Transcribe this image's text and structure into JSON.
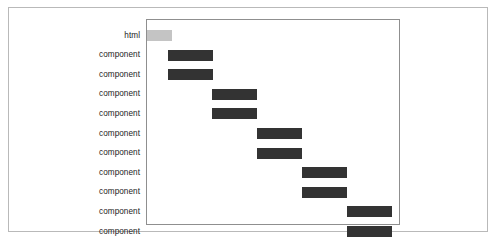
{
  "figure": {
    "background_color": "#ffffff",
    "card_border_color": "#b9b9b9",
    "plot_frame_border_color": "#8f8f8f"
  },
  "chart_data": {
    "type": "bar",
    "orientation": "horizontal",
    "subtype": "gantt-waterfall-timeline",
    "title": "",
    "subtitle": "",
    "xlabel": "",
    "ylabel": "",
    "grid": false,
    "legend": false,
    "xlim": [
      0,
      100
    ],
    "xticks": [],
    "xticklabels": [],
    "categories": [
      "html",
      "component",
      "component",
      "component",
      "component",
      "component",
      "component",
      "component",
      "component",
      "component",
      "component"
    ],
    "bar_color": "#333333",
    "first_bar_color": "#c4c4c4",
    "bars": [
      {
        "label": "html",
        "start": 0.0,
        "end": 9.8,
        "color": "#c4c4c4"
      },
      {
        "label": "component",
        "start": 8.3,
        "end": 26.0,
        "color": "#333333"
      },
      {
        "label": "component",
        "start": 8.3,
        "end": 26.0,
        "color": "#333333"
      },
      {
        "label": "component",
        "start": 25.6,
        "end": 43.3,
        "color": "#333333"
      },
      {
        "label": "component",
        "start": 25.6,
        "end": 43.3,
        "color": "#333333"
      },
      {
        "label": "component",
        "start": 43.3,
        "end": 61.0,
        "color": "#333333"
      },
      {
        "label": "component",
        "start": 43.3,
        "end": 61.0,
        "color": "#333333"
      },
      {
        "label": "component",
        "start": 61.0,
        "end": 78.7,
        "color": "#333333"
      },
      {
        "label": "component",
        "start": 61.0,
        "end": 78.7,
        "color": "#333333"
      },
      {
        "label": "component",
        "start": 78.7,
        "end": 96.5,
        "color": "#333333"
      },
      {
        "label": "component",
        "start": 78.7,
        "end": 96.5,
        "color": "#333333"
      }
    ]
  }
}
